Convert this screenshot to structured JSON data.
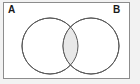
{
  "figure": {
    "name": "venn-diagram",
    "type": "two-set-venn-diagram",
    "caption": "",
    "frame": {
      "border_color": "#8c8c8c",
      "background_color": "#ffffff",
      "outer_background_color": "#f2f2f2"
    }
  },
  "labels": {
    "set_a": "A",
    "set_b": "B"
  },
  "sets": [
    {
      "id": "set-a",
      "label": "A",
      "center_x": 49,
      "center_y": 45,
      "radius": 28,
      "fill": "#ffffff",
      "stroke": "#595959",
      "shaded": false
    },
    {
      "id": "set-b",
      "label": "B",
      "center_x": 90,
      "center_y": 45,
      "radius": 28,
      "fill": "#ffffff",
      "stroke": "#595959",
      "shaded": false
    }
  ],
  "regions": {
    "intersection": {
      "id": "intersection-a-and-b",
      "label": "",
      "shaded": true,
      "fill": "#e8e8e8",
      "stroke": "#595959",
      "description": "A intersect B"
    },
    "a_only": {
      "id": "region-a-only",
      "shaded": false,
      "fill": "#ffffff"
    },
    "b_only": {
      "id": "region-b-only",
      "shaded": false,
      "fill": "#ffffff"
    },
    "outside": {
      "id": "region-universe-outside",
      "shaded": false,
      "fill": "#ffffff"
    }
  },
  "style": {
    "stroke_width": 1,
    "label_font_size": 10,
    "label_color": "#1a1a1a"
  }
}
